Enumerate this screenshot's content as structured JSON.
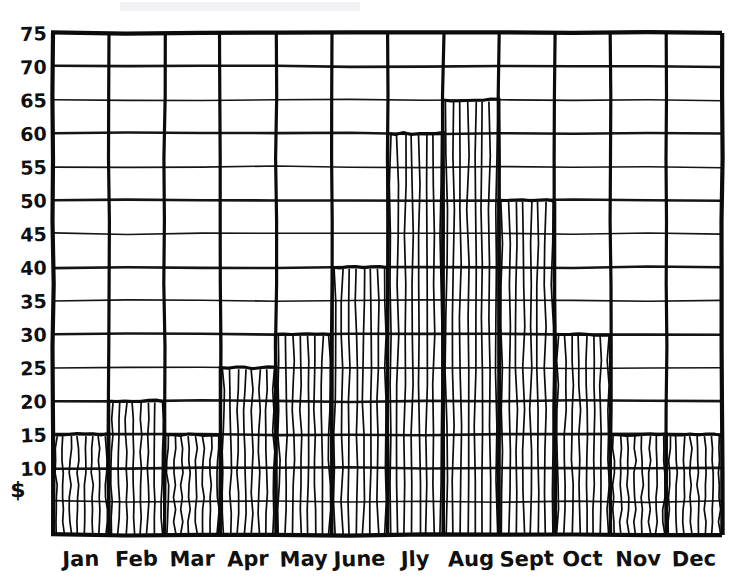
{
  "chart_data": {
    "type": "bar",
    "title": "",
    "subtitle": "",
    "xlabel": "",
    "ylabel": "",
    "currency_symbol": "$",
    "categories": [
      "Jan",
      "Feb",
      "Mar",
      "Apr",
      "May",
      "June",
      "Jly",
      "Aug",
      "Sept",
      "Oct",
      "Nov",
      "Dec"
    ],
    "values": [
      15,
      20,
      15,
      25,
      30,
      40,
      60,
      65,
      50,
      30,
      15,
      15
    ],
    "ylim": [
      0,
      75
    ],
    "ytick_step": 5,
    "ytick_labels": [
      "75",
      "70",
      "65",
      "60",
      "55",
      "50",
      "45",
      "40",
      "35",
      "30",
      "25",
      "20",
      "15",
      "10"
    ],
    "ytick_values": [
      75,
      70,
      65,
      60,
      55,
      50,
      45,
      40,
      35,
      30,
      25,
      20,
      15,
      10
    ],
    "grid": true,
    "legend": "none",
    "style": "hand-drawn",
    "bar_fill": "vertical-hatching",
    "ink_color": "#0b0b0b",
    "background_color": "#ffffff"
  },
  "axis": {
    "y_axis_name": "y-axis",
    "x_axis_name": "x-axis",
    "currency_symbol": "$"
  }
}
